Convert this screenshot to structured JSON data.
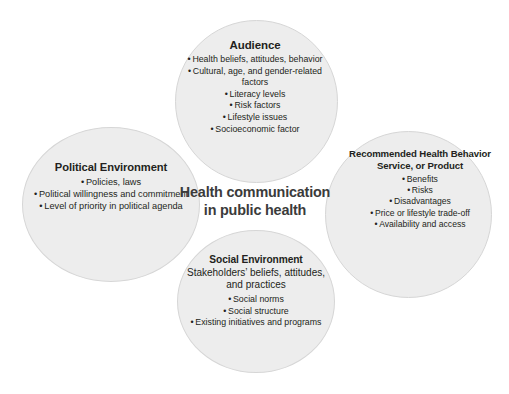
{
  "top_caption": "",
  "colors": {
    "background": "#ffffff",
    "circle_fill": "rgba(196,196,196,0.30)",
    "circle_stroke": "#d6d6d6",
    "text": "#231f20",
    "center_text": "#3b3b3b"
  },
  "diagram": {
    "center": {
      "line1": "Health communication",
      "line2": "in public health"
    },
    "circles": [
      {
        "id": "audience",
        "position": "top",
        "title": "Audience",
        "subtitle": "",
        "items": [
          "Health beliefs, attitudes, behavior",
          "Cultural, age, and gender-related factors",
          "Literacy levels",
          "Risk factors",
          "Lifestyle issues",
          "Socioeconomic factor"
        ]
      },
      {
        "id": "political-environment",
        "position": "left",
        "title": "Political Environment",
        "subtitle": "",
        "items": [
          "Policies, laws",
          "Political willingness and commitment",
          "Level of priority in political agenda"
        ]
      },
      {
        "id": "recommended-health-behavior",
        "position": "right",
        "title": "Recommended Health Behavior Service, or Product",
        "subtitle": "",
        "items": [
          "Benefits",
          "Risks",
          "Disadvantages",
          "Price or lifestyle trade-off",
          "Availability and access"
        ]
      },
      {
        "id": "social-environment",
        "position": "bottom",
        "title": "Social Environment",
        "subtitle": "Stakeholders’ beliefs, attitudes, and practices",
        "items": [
          "Social norms",
          "Social structure",
          "Existing initiatives and programs"
        ]
      }
    ]
  }
}
